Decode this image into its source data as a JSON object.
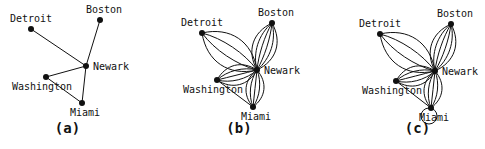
{
  "figure": {
    "panels": [
      {
        "caption": "(a)",
        "nodes": [
          {
            "id": "Detroit",
            "label": "Detroit",
            "x": 31,
            "y": 29
          },
          {
            "id": "Boston",
            "label": "Boston",
            "x": 100,
            "y": 20
          },
          {
            "id": "Newark",
            "label": "Newark",
            "x": 86,
            "y": 66
          },
          {
            "id": "Washington",
            "label": "Washington",
            "x": 46,
            "y": 77
          },
          {
            "id": "Miami",
            "label": "Miami",
            "x": 82,
            "y": 103
          }
        ],
        "edges": [
          {
            "from": "Detroit",
            "to": "Newark",
            "multiplicity": 1
          },
          {
            "from": "Boston",
            "to": "Newark",
            "multiplicity": 1
          },
          {
            "from": "Washington",
            "to": "Newark",
            "multiplicity": 1
          },
          {
            "from": "Washington",
            "to": "Miami",
            "multiplicity": 1
          },
          {
            "from": "Newark",
            "to": "Miami",
            "multiplicity": 1
          }
        ]
      },
      {
        "caption": "(b)",
        "nodes": [
          {
            "id": "Detroit",
            "label": "Detroit",
            "x": 202,
            "y": 33
          },
          {
            "id": "Boston",
            "label": "Boston",
            "x": 272,
            "y": 23
          },
          {
            "id": "Newark",
            "label": "Newark",
            "x": 257,
            "y": 70
          },
          {
            "id": "Washington",
            "label": "Washington",
            "x": 217,
            "y": 80
          },
          {
            "id": "Miami",
            "label": "Miami",
            "x": 253,
            "y": 107
          }
        ],
        "edges": [
          {
            "from": "Detroit",
            "to": "Newark",
            "multiplicity": 4
          },
          {
            "from": "Boston",
            "to": "Newark",
            "multiplicity": 6
          },
          {
            "from": "Washington",
            "to": "Newark",
            "multiplicity": 5
          },
          {
            "from": "Newark",
            "to": "Miami",
            "multiplicity": 5
          },
          {
            "from": "Washington",
            "to": "Miami",
            "multiplicity": 1
          }
        ]
      },
      {
        "caption": "(c)",
        "nodes": [
          {
            "id": "Detroit",
            "label": "Detroit",
            "x": 380,
            "y": 34
          },
          {
            "id": "Boston",
            "label": "Boston",
            "x": 451,
            "y": 24
          },
          {
            "id": "Newark",
            "label": "Newark",
            "x": 435,
            "y": 71
          },
          {
            "id": "Washington",
            "label": "Washington",
            "x": 396,
            "y": 81
          },
          {
            "id": "Miami",
            "label": "Miami",
            "x": 431,
            "y": 108
          }
        ],
        "edges": [
          {
            "from": "Detroit",
            "to": "Newark",
            "multiplicity": 4
          },
          {
            "from": "Boston",
            "to": "Newark",
            "multiplicity": 6
          },
          {
            "from": "Washington",
            "to": "Newark",
            "multiplicity": 5
          },
          {
            "from": "Newark",
            "to": "Miami",
            "multiplicity": 5
          },
          {
            "from": "Washington",
            "to": "Miami",
            "multiplicity": 1
          }
        ],
        "loops": [
          {
            "node": "Miami"
          }
        ]
      }
    ]
  }
}
